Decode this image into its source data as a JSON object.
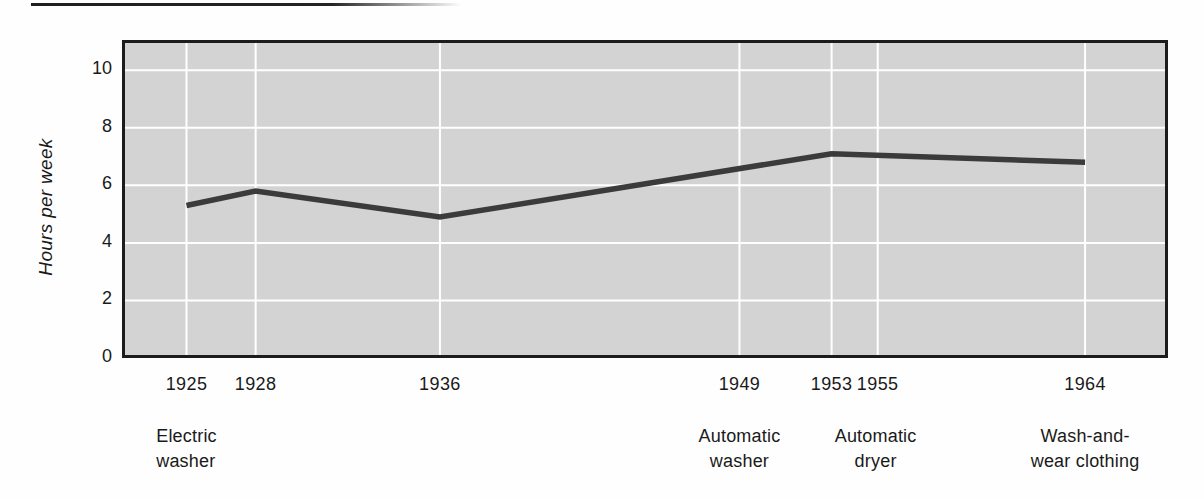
{
  "chart_data": {
    "type": "line",
    "title": "",
    "xlabel": "",
    "ylabel": "Hours per week",
    "x_ticks": [
      1925,
      1928,
      1936,
      1949,
      1953,
      1955,
      1964
    ],
    "y_ticks": [
      0,
      2,
      4,
      6,
      8,
      10
    ],
    "xlim": [
      1922.2,
      1967.6
    ],
    "ylim": [
      0,
      11.05
    ],
    "grid": true,
    "legend": "none",
    "series": [
      {
        "name": "Hours per week spent on laundry",
        "x": [
          1925,
          1928,
          1936,
          1953,
          1964
        ],
        "y": [
          5.3,
          5.8,
          4.9,
          7.1,
          6.8
        ]
      }
    ],
    "annotations": [
      {
        "year": 1925,
        "text": "Electric\nwasher"
      },
      {
        "year": 1949,
        "text": "Automatic\nwasher"
      },
      {
        "year": 1953,
        "text": "Automatic\ndryer"
      },
      {
        "year": 1964,
        "text": "Wash-and-\nwear clothing"
      }
    ],
    "colors": {
      "plot_bg": "#d3d3d3",
      "gridline": "#ffffff",
      "line": "#3b3b3b",
      "frame": "#1c1c1c",
      "text": "#1a1a1a",
      "top_rule": "#222222"
    }
  }
}
